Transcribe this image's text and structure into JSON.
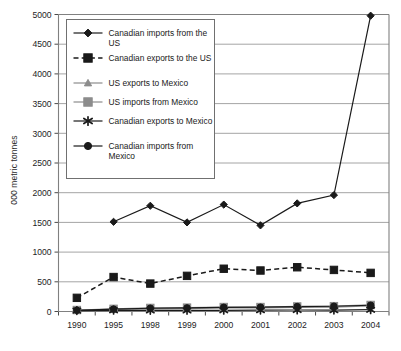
{
  "chart_data": {
    "type": "line",
    "title": "",
    "xlabel": "",
    "ylabel": "000 metric tonnes",
    "x": [
      "1990",
      "1995",
      "1998",
      "1999",
      "2000",
      "2001",
      "2002",
      "2003",
      "2004"
    ],
    "ylim": [
      0,
      5000
    ],
    "ytick_labels": [
      "0",
      "500",
      "1000",
      "1500",
      "2000",
      "2500",
      "3000",
      "3500",
      "4000",
      "4500",
      "5000"
    ],
    "ytick_values": [
      0,
      500,
      1000,
      1500,
      2000,
      2500,
      3000,
      3500,
      4000,
      4500,
      5000
    ],
    "grid": "horizontal",
    "legend_position": "upper-left-inside",
    "series": [
      {
        "name": "Canadian imports from the US",
        "marker": "diamond",
        "line": "solid",
        "color": "#1a1a1a",
        "values": [
          null,
          1510,
          1780,
          1500,
          1800,
          1450,
          1820,
          1960,
          4980
        ]
      },
      {
        "name": "Canadian exports to the US",
        "marker": "square",
        "line": "dashed",
        "color": "#1a1a1a",
        "values": [
          230,
          580,
          470,
          600,
          720,
          690,
          745,
          700,
          650
        ]
      },
      {
        "name": "US exports to Mexico",
        "marker": "triangle",
        "line": "solid",
        "color": "#8c8c8c",
        "values": [
          20,
          35,
          45,
          50,
          60,
          60,
          70,
          75,
          95
        ]
      },
      {
        "name": "US imports from Mexico",
        "marker": "square",
        "line": "solid",
        "color": "#8c8c8c",
        "values": [
          25,
          45,
          60,
          65,
          75,
          75,
          85,
          90,
          110
        ]
      },
      {
        "name": "Canadian exports to Mexico",
        "marker": "asterisk",
        "line": "solid",
        "color": "#1a1a1a",
        "values": [
          15,
          20,
          18,
          18,
          20,
          22,
          25,
          22,
          30
        ]
      },
      {
        "name": "Canadian imports from Mexico",
        "marker": "circle",
        "line": "solid",
        "color": "#1a1a1a",
        "values": [
          20,
          40,
          55,
          60,
          70,
          72,
          82,
          88,
          105
        ]
      }
    ]
  },
  "legend": {
    "items": [
      {
        "label": "Canadian imports from the US",
        "marker": "diamond-marker",
        "style": "solid",
        "color": "#1a1a1a"
      },
      {
        "label": "Canadian exports to the US",
        "marker": "square-marker",
        "style": "dashed",
        "color": "#1a1a1a"
      },
      {
        "label": "US exports to Mexico",
        "marker": "triangle-marker",
        "style": "solid",
        "color": "#8c8c8c"
      },
      {
        "label": "US imports from Mexico",
        "marker": "square-marker",
        "style": "solid",
        "color": "#8c8c8c"
      },
      {
        "label": "Canadian exports to Mexico",
        "marker": "asterisk-marker",
        "style": "solid",
        "color": "#1a1a1a"
      },
      {
        "label": "Canadian imports from Mexico",
        "marker": "circle-marker",
        "style": "solid",
        "color": "#1a1a1a"
      }
    ]
  },
  "axis": {
    "y_title": "000 metric tonnes"
  },
  "colors": {
    "black": "#1a1a1a",
    "gray": "#8c8c8c",
    "grid": "#9a9a9a",
    "frame": "#808080",
    "background": "#ffffff"
  }
}
